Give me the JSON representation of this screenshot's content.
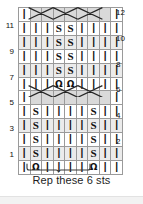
{
  "chart": {
    "title": "",
    "columns": 9,
    "rows": 12,
    "symbols": {
      "knit": "|",
      "purl_twist": "S",
      "twisted_knit": "Ω",
      "cable": "",
      "blank": ""
    },
    "symbol_names": {
      "knit": "knit-stitch-symbol",
      "purl_twist": "s-twist-stitch-symbol",
      "twisted_knit": "omega-twist-stitch-symbol",
      "cable": "cable-cross-symbol",
      "blank": "blank-cell"
    },
    "colors": {
      "grid_line": "#9a9a9a",
      "border": "#555555",
      "shade": "#d9d9d9",
      "shade_light": "#ebebeb",
      "symbol": "#111111",
      "text": "#1d1d1d",
      "background": "#ffffff"
    },
    "row_numbers_left": [
      "",
      "11",
      "",
      "9",
      "",
      "7",
      "",
      "5",
      "",
      "3",
      "",
      "1"
    ],
    "row_numbers_right": [
      "12",
      "",
      "10",
      "",
      "8",
      "",
      "6",
      "",
      "4",
      "",
      "2",
      ""
    ],
    "rows_top_to_bottom": [
      {
        "number": 12,
        "side": "right",
        "type": "cable",
        "cable_span": [
          2,
          8
        ],
        "cells": [
          "knit",
          "cable",
          "cable",
          "cable",
          "cable",
          "cable",
          "cable",
          "cable",
          "knit"
        ]
      },
      {
        "number": 11,
        "side": "left",
        "type": "plain",
        "cells": [
          "knit",
          "knit",
          "knit",
          "purl_twist",
          "purl_twist",
          "knit",
          "knit",
          "knit",
          "knit"
        ]
      },
      {
        "number": 10,
        "side": "right",
        "type": "plain",
        "cells": [
          "knit",
          "knit",
          "knit",
          "purl_twist",
          "purl_twist",
          "knit",
          "knit",
          "knit",
          "knit"
        ]
      },
      {
        "number": 9,
        "side": "left",
        "type": "plain",
        "cells": [
          "knit",
          "knit",
          "knit",
          "purl_twist",
          "purl_twist",
          "knit",
          "knit",
          "knit",
          "knit"
        ]
      },
      {
        "number": 8,
        "side": "right",
        "type": "plain",
        "cells": [
          "knit",
          "knit",
          "knit",
          "purl_twist",
          "purl_twist",
          "knit",
          "knit",
          "knit",
          "knit"
        ]
      },
      {
        "number": 7,
        "side": "left",
        "type": "plain",
        "cells": [
          "knit",
          "knit",
          "knit",
          "twisted_knit",
          "twisted_knit",
          "knit",
          "knit",
          "knit",
          "knit"
        ]
      },
      {
        "number": 6,
        "side": "right",
        "type": "cable",
        "cable_span": [
          2,
          8
        ],
        "cells": [
          "knit",
          "cable",
          "cable",
          "cable",
          "cable",
          "cable",
          "cable",
          "cable",
          "knit"
        ]
      },
      {
        "number": 5,
        "side": "left",
        "type": "plain",
        "cells": [
          "knit",
          "purl_twist",
          "knit",
          "knit",
          "knit",
          "knit",
          "purl_twist",
          "knit",
          "knit"
        ]
      },
      {
        "number": 4,
        "side": "right",
        "type": "plain",
        "cells": [
          "knit",
          "purl_twist",
          "knit",
          "knit",
          "knit",
          "knit",
          "purl_twist",
          "knit",
          "knit"
        ]
      },
      {
        "number": 3,
        "side": "left",
        "type": "plain",
        "cells": [
          "knit",
          "purl_twist",
          "knit",
          "knit",
          "knit",
          "knit",
          "purl_twist",
          "knit",
          "knit"
        ]
      },
      {
        "number": 2,
        "side": "right",
        "type": "plain",
        "cells": [
          "knit",
          "purl_twist",
          "knit",
          "knit",
          "knit",
          "knit",
          "purl_twist",
          "knit",
          "knit"
        ]
      },
      {
        "number": 1,
        "side": "left",
        "type": "plain",
        "cells": [
          "knit",
          "twisted_knit",
          "knit",
          "knit",
          "knit",
          "knit",
          "twisted_knit",
          "knit",
          "knit"
        ]
      }
    ],
    "repeat": {
      "caption": "Rep these 6 sts",
      "stitch_count": 6,
      "span_columns": [
        2,
        7
      ]
    }
  }
}
